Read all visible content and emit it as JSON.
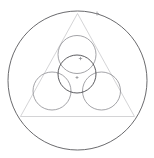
{
  "canvas": {
    "width": 154,
    "height": 158,
    "background": "#ffffff"
  },
  "figure": {
    "colors": {
      "outer_circle_stroke": "#59595c",
      "triangle_stroke": "#c9c9cc",
      "inner_circle_stroke": "#8c8c90",
      "center_circle_stroke": "#4a4a4e",
      "marker_stroke": "#8a8a8e",
      "background": "#ffffff"
    },
    "stroke_widths": {
      "outer_circle": 0.9,
      "triangle": 0.8,
      "inner_circle": 0.8,
      "center_circle": 0.9,
      "marker": 0.7
    },
    "outer_circle": {
      "label": "circumscribed-circle",
      "cx": 77.5,
      "cy": 80.5,
      "r": 69.5
    },
    "triangle": {
      "label": "inscribed-equilateral-triangle",
      "points": "77.5,13.5 20.5,116.5 134.5,116.5",
      "vertices": [
        {
          "name": "apex",
          "x": 77.5,
          "y": 13.5
        },
        {
          "name": "bottom-left",
          "x": 20.5,
          "y": 116.5
        },
        {
          "name": "bottom-right",
          "x": 134.5,
          "y": 116.5
        }
      ]
    },
    "inner_circles": [
      {
        "label": "top-circle",
        "cx": 77.0,
        "cy": 54.5,
        "r": 19.0
      },
      {
        "label": "left-circle",
        "cx": 52.0,
        "cy": 91.0,
        "r": 19.0
      },
      {
        "label": "right-circle",
        "cx": 101.5,
        "cy": 91.0,
        "r": 19.0
      }
    ],
    "center_circle": {
      "label": "central-circle",
      "cx": 77.0,
      "cy": 74.0,
      "r": 19.0
    },
    "markers": [
      {
        "label": "marker-outer-top-right",
        "x": 97.0,
        "y": 13.5,
        "size": 4.0
      },
      {
        "label": "marker-center-circle-upper",
        "x": 80.5,
        "y": 58.5,
        "size": 3.4
      },
      {
        "label": "marker-tangency-center",
        "x": 77.0,
        "y": 77.5,
        "size": 3.0
      }
    ]
  }
}
